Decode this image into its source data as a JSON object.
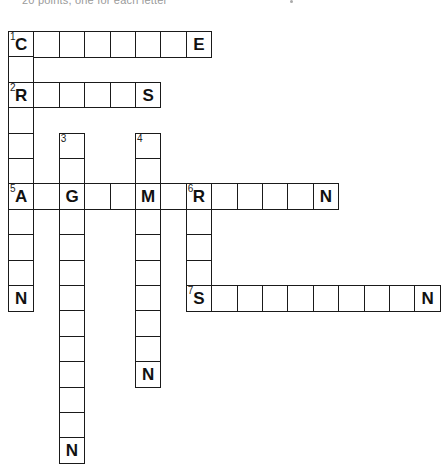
{
  "header": {
    "note": "20 points, one for each letter"
  },
  "puzzle": {
    "cell_size": 25.4,
    "origin_x": 8,
    "origin_y": 31,
    "words": [
      {
        "number": 1,
        "direction": "across",
        "row": 0,
        "col": 0,
        "length": 8,
        "given": {
          "0": "C",
          "7": "E"
        }
      },
      {
        "number": 1,
        "direction": "down",
        "row": 0,
        "col": 0,
        "length": 11,
        "given": {
          "0": "C",
          "2": "R",
          "6": "A",
          "10": "N"
        }
      },
      {
        "number": 2,
        "direction": "across",
        "row": 2,
        "col": 0,
        "length": 6,
        "given": {
          "0": "R",
          "5": "S"
        }
      },
      {
        "number": 3,
        "direction": "down",
        "row": 4,
        "col": 2,
        "length": 13,
        "given": {
          "2": "G",
          "12": "N"
        }
      },
      {
        "number": 4,
        "direction": "down",
        "row": 4,
        "col": 5,
        "length": 10,
        "given": {
          "2": "M",
          "9": "N"
        }
      },
      {
        "number": 5,
        "direction": "across",
        "row": 6,
        "col": 0,
        "length": 13,
        "given": {
          "0": "A",
          "2": "G",
          "5": "M",
          "7": "R",
          "12": "N"
        }
      },
      {
        "number": 6,
        "direction": "down",
        "row": 6,
        "col": 7,
        "length": 5,
        "given": {
          "0": "R",
          "4": "S"
        }
      },
      {
        "number": 7,
        "direction": "across",
        "row": 10,
        "col": 7,
        "length": 10,
        "given": {
          "0": "S",
          "9": "N"
        }
      }
    ]
  }
}
